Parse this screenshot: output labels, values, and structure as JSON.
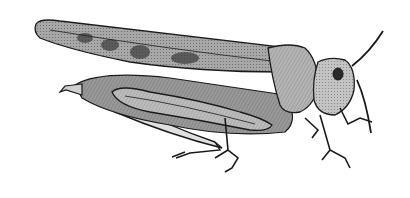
{
  "image": {
    "subject": "grasshopper",
    "style": "black and white engraving illustration",
    "background": "#ffffff",
    "ink": "#1a1a1a",
    "shade": "#6b6b6b",
    "light": "#c8c8c8"
  }
}
